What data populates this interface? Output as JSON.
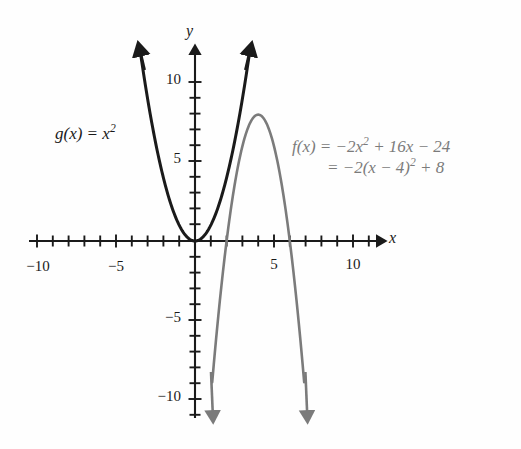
{
  "chart_data": {
    "type": "line",
    "title": "",
    "subtitle": "",
    "xlabel": "x",
    "ylabel": "y",
    "xlim": [
      -11.5,
      12.5
    ],
    "ylim": [
      -11.5,
      12.5
    ],
    "grid": false,
    "legend_position": "inline-annotations",
    "x_tick_labels": [
      "-10",
      "-5",
      "5",
      "10"
    ],
    "x_tick_values": [
      -10,
      -5,
      5,
      10
    ],
    "y_tick_labels": [
      "10",
      "5",
      "-5",
      "-10"
    ],
    "y_tick_values": [
      10,
      5,
      -5,
      -10
    ],
    "minor_tick_interval": 1,
    "series": [
      {
        "name": "g",
        "equation_label": "g(x) = x",
        "equation_exponent": "2",
        "formula": "g(x) = x^2",
        "color": "#1a1a1a",
        "vertex": [
          0,
          0
        ],
        "leading_coefficient": 1,
        "x": [
          -3.4,
          -3.0,
          -2.5,
          -2.0,
          -1.5,
          -1.0,
          -0.5,
          0,
          0.5,
          1.0,
          1.5,
          2.0,
          2.5,
          3.0,
          3.4
        ],
        "y": [
          11.56,
          9.0,
          6.25,
          4.0,
          2.25,
          1.0,
          0.25,
          0,
          0.25,
          1.0,
          2.25,
          4.0,
          6.25,
          9.0,
          11.56
        ],
        "arrows": [
          "up-left",
          "up-right"
        ]
      },
      {
        "name": "f",
        "equation_line1_pre": "f(x) = −2x",
        "equation_line1_exp": "2",
        "equation_line1_post": " + 16x − 24",
        "equation_line2_pre": "= −2(x − 4)",
        "equation_line2_exp": "2",
        "equation_line2_post": " + 8",
        "formula": "f(x) = -2x^2 + 16x - 24 = -2(x - 4)^2 + 8",
        "color": "#7b7b7b",
        "vertex": [
          4,
          8
        ],
        "leading_coefficient": -2,
        "roots": [
          2,
          6
        ],
        "x": [
          1.1,
          1.5,
          2.0,
          2.5,
          3.0,
          3.5,
          4.0,
          4.5,
          5.0,
          5.5,
          6.0,
          6.5,
          6.9
        ],
        "y": [
          -8.82,
          -4.5,
          0,
          3.5,
          6.0,
          7.5,
          8.0,
          7.5,
          6.0,
          3.5,
          0,
          -4.5,
          -8.82
        ],
        "arrows": [
          "down-left",
          "down-right"
        ]
      }
    ]
  },
  "axes": {
    "x_label": "x",
    "y_label": "y",
    "origin_px": [
      195,
      241
    ],
    "unit_px": 15.8
  },
  "annotations": {
    "g_label": {
      "text_pre": "g(x) = x",
      "exponent": "2"
    },
    "f_label": {
      "line1_pre": "f(x) = −2x",
      "line1_exp": "2",
      "line1_post": " + 16x − 24",
      "line2_pre": "= −2(x − 4)",
      "line2_exp": "2",
      "line2_post": " + 8"
    }
  },
  "colors": {
    "background": "#fefefe",
    "axis": "#1a1a1a",
    "curve_g": "#1a1a1a",
    "curve_f": "#7b7b7b"
  },
  "tick_labels": {
    "x_neg10": "−10",
    "x_neg5": "−5",
    "x_pos5": "5",
    "x_pos10": "10",
    "y_pos10": "10",
    "y_pos5": "5",
    "y_neg5": "−5",
    "y_neg10": "−10"
  }
}
